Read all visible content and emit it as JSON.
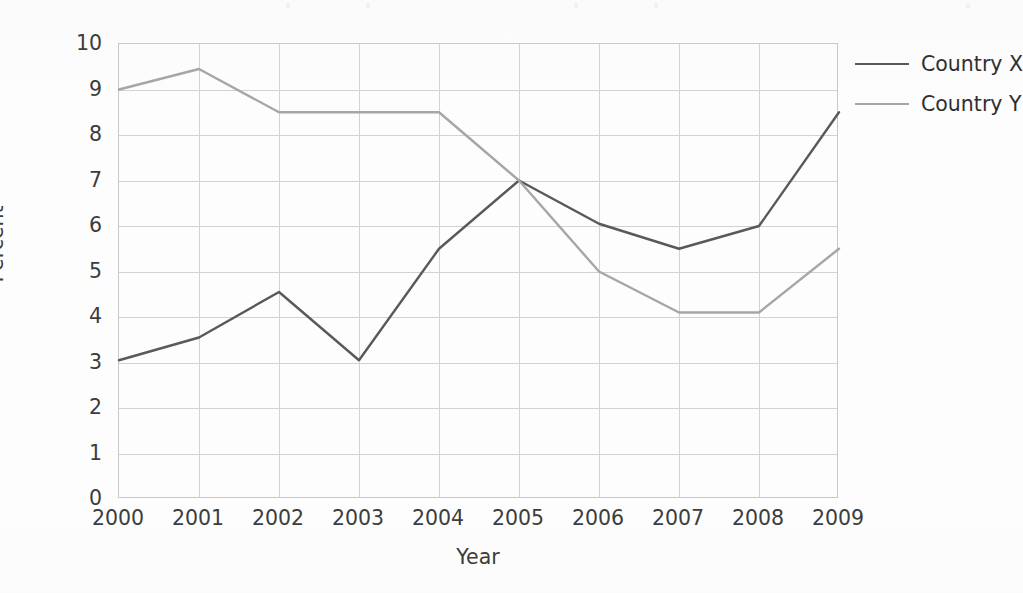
{
  "chart_data": {
    "type": "line",
    "title": "",
    "xlabel": "Year",
    "ylabel": "Percent",
    "categories": [
      "2000",
      "2001",
      "2002",
      "2003",
      "2004",
      "2005",
      "2006",
      "2007",
      "2008",
      "2009"
    ],
    "x": [
      2000,
      2001,
      2002,
      2003,
      2004,
      2005,
      2006,
      2007,
      2008,
      2009
    ],
    "xlim": [
      2000,
      2009
    ],
    "ylim": [
      0,
      10
    ],
    "yticks": [
      0,
      1,
      2,
      3,
      4,
      5,
      6,
      7,
      8,
      9,
      10
    ],
    "ytick_labels": [
      "0",
      "1",
      "2",
      "3",
      "4",
      "5",
      "6",
      "7",
      "8",
      "9",
      "10"
    ],
    "grid": true,
    "grid_axis": "both",
    "legend_position": "right",
    "markers": false,
    "series": [
      {
        "name": "Country X",
        "color": "#595959",
        "values": [
          3.05,
          3.55,
          4.55,
          3.05,
          5.5,
          7.0,
          6.05,
          5.5,
          6.0,
          8.5
        ]
      },
      {
        "name": "Country Y",
        "color": "#a6a6a6",
        "values": [
          9.0,
          9.45,
          8.5,
          8.5,
          8.5,
          7.0,
          5.0,
          4.1,
          4.1,
          5.5
        ]
      }
    ]
  },
  "legend": {
    "items": [
      {
        "label": "Country X",
        "color": "#595959"
      },
      {
        "label": "Country Y",
        "color": "#a6a6a6"
      }
    ]
  },
  "axes": {
    "y_title": "Percent",
    "x_title": "Year"
  }
}
